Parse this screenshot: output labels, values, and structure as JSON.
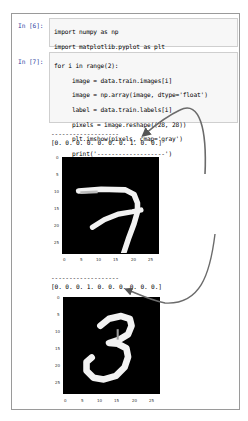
{
  "cells": [
    {
      "prompt": "In [6]:",
      "lines": [
        "import numpy as np",
        "import matplotlib.pyplot as plt",
        "%matplotlib inline"
      ]
    },
    {
      "prompt": "In [7]:",
      "lines": [
        "for i in range(2):",
        "     image = data.train.images[i]",
        "     image = np.array(image, dtype='float')",
        "     label = data.train.labels[i]",
        "     pixels = image.reshape((28, 28))",
        "     plt.imshow(pixels, cmap='gray')",
        "     print('-------------------')",
        "     print(label)",
        "     plt.show()"
      ]
    }
  ],
  "outputs": [
    {
      "separator": "-------------------",
      "label": "[0. 0. 0. 0. 0. 0. 0. 1. 0. 0.]",
      "digit": "7"
    },
    {
      "separator": "-------------------",
      "label": "[0. 0. 0. 1. 0. 0. 0. 0. 0. 0.]",
      "digit": "3"
    }
  ],
  "axis_ticks": {
    "y": [
      "0",
      "5",
      "10",
      "15",
      "20",
      "25"
    ],
    "x": [
      "0",
      "5",
      "10",
      "15",
      "20",
      "25"
    ]
  },
  "colors": {
    "prompt": "#303f9f",
    "cell_bg": "#f7f7f7",
    "arrow": "#6b6b6b"
  }
}
